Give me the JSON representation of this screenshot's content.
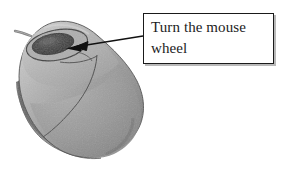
{
  "figure": {
    "type": "annotated-photograph",
    "width": 282,
    "height": 171,
    "background_color": "#ffffff"
  },
  "callout": {
    "text": "Turn the mouse\nwheel",
    "line1": "Turn the mouse",
    "line2": "wheel",
    "border_color": "#1a1a1a",
    "fill_color": "#ffffff",
    "shadow_color": "#b9b9b9",
    "text_color": "#1c1c1c"
  },
  "arrow": {
    "color": "#111111",
    "from_x": 143,
    "from_y": 36,
    "to_x": 66,
    "to_y": 48,
    "points_to": "scroll-wheel"
  },
  "photo": {
    "palette": {
      "body_light": "#bdbdbd",
      "body_mid": "#9a9a9a",
      "body_dark": "#7c7c7c",
      "skirt_dark": "#5c5c5c",
      "outline": "#4a4a4a",
      "wheel_dark": "#3c3c3c",
      "wheel_ring": "#8e8e8e",
      "cable": "#7a7a7a",
      "highlight": "#d2d2d2"
    },
    "parts": [
      "mouse-body",
      "mouse-base-skirt",
      "scroll-wheel",
      "scroll-wheel-recess",
      "left-button-seam",
      "right-button-seam",
      "cable"
    ]
  }
}
